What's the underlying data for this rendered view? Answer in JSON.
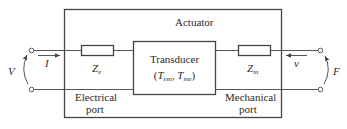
{
  "diagram": {
    "outer_box_label": "Actuator",
    "transducer": {
      "title": "Transducer",
      "params": [
        "T",
        "em",
        "T",
        "me"
      ]
    },
    "electrical_impedance": {
      "symbol": "Z",
      "subscript": "e"
    },
    "mechanical_impedance": {
      "symbol": "Z",
      "subscript": "m"
    },
    "electrical_port": {
      "line1": "Electrical",
      "line2": "port"
    },
    "mechanical_port": {
      "line1": "Mechanical",
      "line2": "port"
    },
    "electrical_voltage": "V",
    "electrical_current": "I",
    "mechanical_velocity": "v",
    "mechanical_force": "F",
    "colors": {
      "line": "#555555",
      "text": "#2a2a2a",
      "background": "#ffffff"
    }
  }
}
